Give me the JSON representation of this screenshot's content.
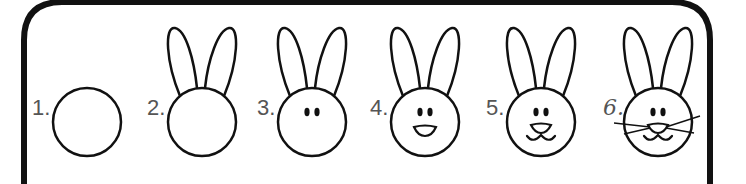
{
  "colors": {
    "stroke": "#111111",
    "label": "#555555",
    "background": "#ffffff",
    "border": "#111111"
  },
  "steps": [
    {
      "label": "1.",
      "description": "Draw a circle",
      "cx": 87,
      "cy": 122,
      "ears": false,
      "eyes": false,
      "nose": "none",
      "mouth": false,
      "whiskers": false
    },
    {
      "label": "2.",
      "description": "Add two long ears",
      "cx": 202,
      "cy": 122,
      "ears": true,
      "eyes": false,
      "nose": "none",
      "mouth": false,
      "whiskers": false
    },
    {
      "label": "3.",
      "description": "Add two oval eyes",
      "cx": 312,
      "cy": 122,
      "ears": true,
      "eyes": true,
      "nose": "none",
      "mouth": false,
      "whiskers": false
    },
    {
      "label": "4.",
      "description": "Add a nose",
      "cx": 425,
      "cy": 122,
      "ears": true,
      "eyes": true,
      "nose": "mouth-shape",
      "mouth": false,
      "whiskers": false
    },
    {
      "label": "5.",
      "description": "Add nose and mouth",
      "cx": 541,
      "cy": 122,
      "ears": true,
      "eyes": true,
      "nose": "triangle",
      "mouth": true,
      "whiskers": false
    },
    {
      "label": "6.",
      "description": "Add whiskers",
      "cx": 658,
      "cy": 122,
      "ears": true,
      "eyes": true,
      "nose": "triangle",
      "mouth": true,
      "whiskers": true
    }
  ]
}
